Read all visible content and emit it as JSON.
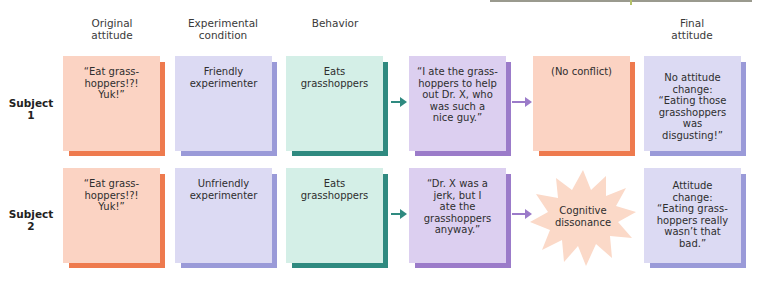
{
  "columns": [
    {
      "label": "Original\nattitude",
      "line1": "Original",
      "line2": "attitude"
    },
    {
      "label": "Experimental condition",
      "line1": "Experimental",
      "line2": "condition"
    },
    {
      "label": "Behavior",
      "line1": "Behavior",
      "line2": ""
    },
    {
      "label": "Final attitude",
      "line1": "Final",
      "line2": "attitude"
    }
  ],
  "rows": [
    {
      "label_line1": "Subject",
      "label_line2": "1",
      "original_attitude": [
        "“Eat grass-",
        "hoppers!?!",
        "Yuk!”"
      ],
      "condition": [
        "Friendly",
        "experimenter"
      ],
      "behavior": [
        "Eats",
        "grasshoppers"
      ],
      "justification": [
        "“I ate the grass-",
        "hoppers to help",
        "out Dr. X, who",
        "was such a",
        "nice guy.”"
      ],
      "conflict": [
        "(No conflict)"
      ],
      "final_attitude": [
        "No attitude",
        "change:",
        "“Eating those",
        "grasshoppers was",
        "disgusting!”"
      ]
    },
    {
      "label_line1": "Subject",
      "label_line2": "2",
      "original_attitude": [
        "“Eat grass-",
        "hoppers!?!",
        "Yuk!”"
      ],
      "condition": [
        "Unfriendly",
        "experimenter"
      ],
      "behavior": [
        "Eats",
        "grasshoppers"
      ],
      "justification": [
        "“Dr. X was a",
        "jerk, but I",
        "ate the",
        "grasshoppers",
        "anyway.”"
      ],
      "conflict": [
        "Cognitive",
        "dissonance"
      ],
      "final_attitude": [
        "Attitude",
        "change:",
        "“Eating grass-",
        "hoppers really",
        "wasn’t that",
        "bad.”"
      ]
    }
  ],
  "colors": {
    "orange_fill": "#fbd3c3",
    "orange_edge": "#ee7a4e",
    "lavender_fill": "#dcdaf3",
    "lavender_edge": "#9a9ad8",
    "teal_fill": "#d4efe7",
    "teal_edge": "#2f8a80",
    "purple_fill": "#dccff0",
    "purple_edge": "#9b7bc9",
    "star_fill": "#fbd9c8"
  }
}
